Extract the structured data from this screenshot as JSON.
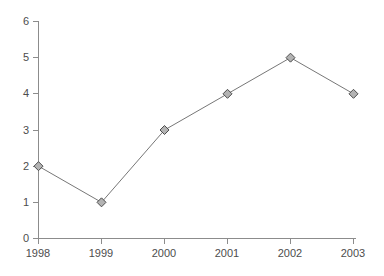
{
  "chart_data": {
    "type": "line",
    "title": "",
    "xlabel": "",
    "ylabel": "",
    "categories": [
      "1998",
      "1999",
      "2000",
      "2001",
      "2002",
      "2003"
    ],
    "values": [
      2,
      1,
      3,
      4,
      5,
      4
    ],
    "series": [
      {
        "name": "",
        "values": [
          2,
          1,
          3,
          4,
          5,
          4
        ]
      }
    ],
    "ylim": [
      0,
      6
    ],
    "y_ticks": [
      0,
      1,
      2,
      3,
      4,
      5,
      6
    ],
    "y_tick_labels": [
      "0",
      "1",
      "2",
      "3",
      "4",
      "5",
      "6"
    ],
    "x_tick_labels": [
      "1998",
      "1999",
      "2000",
      "2001",
      "2002",
      "2003"
    ],
    "grid": false,
    "legend": "none",
    "marker": "diamond",
    "colors": {
      "background": "#ffffff",
      "axis": "#8c8c8c",
      "line": "#777777",
      "marker_fill": "#b3b3b3",
      "marker_stroke": "#4d4d4d",
      "text": "#4d4d4d"
    }
  },
  "labels": {
    "y": {
      "t0": "0",
      "t1": "1",
      "t2": "2",
      "t3": "3",
      "t4": "4",
      "t5": "5",
      "t6": "6"
    },
    "x": {
      "t0": "1998",
      "t1": "1999",
      "t2": "2000",
      "t3": "2001",
      "t4": "2002",
      "t5": "2003"
    }
  }
}
